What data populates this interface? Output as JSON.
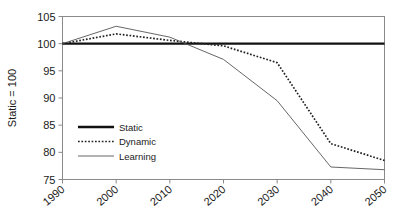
{
  "chart_data": {
    "type": "line",
    "title": "",
    "subtitle": "",
    "xlabel": "",
    "ylabel": "Static = 100",
    "x": [
      1990,
      2000,
      2010,
      2020,
      2030,
      2040,
      2050
    ],
    "xtick_labels": [
      "1990",
      "2000",
      "2010",
      "2020",
      "2030",
      "2040",
      "2050"
    ],
    "ytick_labels": [
      "75",
      "80",
      "85",
      "90",
      "95",
      "100",
      "105"
    ],
    "ytick_values": [
      75,
      80,
      85,
      90,
      95,
      100,
      105
    ],
    "xlim": [
      1990,
      2050
    ],
    "ylim": [
      75,
      105
    ],
    "grid": false,
    "legend_position": "center-left",
    "series": [
      {
        "name": "Static",
        "style": "solid-thick",
        "color": "#111111",
        "values": [
          100,
          100,
          100,
          100,
          100,
          100,
          100
        ]
      },
      {
        "name": "Dynamic",
        "style": "dotted",
        "color": "#222222",
        "values": [
          100,
          101.8,
          100.6,
          99.6,
          96.5,
          81.6,
          78.5
        ]
      },
      {
        "name": "Learning",
        "style": "solid-thin",
        "color": "#555555",
        "values": [
          100,
          103.2,
          101.2,
          97.1,
          89.5,
          77.3,
          76.8
        ]
      }
    ]
  },
  "legend": {
    "entries": [
      {
        "label": "Static"
      },
      {
        "label": "Dynamic"
      },
      {
        "label": "Learning"
      }
    ]
  },
  "axes": {
    "y_title": "Static = 100"
  }
}
